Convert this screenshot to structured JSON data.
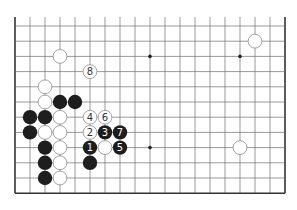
{
  "diagram": {
    "type": "go-board-fragment",
    "board_size": 19,
    "visible_rows": [
      7,
      18
    ],
    "visible_cols": [
      0,
      18
    ],
    "colors": {
      "background": "#ffffff",
      "grid_line": "#6e6e6e",
      "edge_line": "#333333",
      "black_stone": "#1e1e1e",
      "white_stone_fill": "#ffffff",
      "white_stone_stroke": "#8a8a8a",
      "star_point": "#222222"
    },
    "star_points": [
      {
        "col": 9,
        "row": 9
      },
      {
        "col": 15,
        "row": 9
      },
      {
        "col": 9,
        "row": 15
      }
    ],
    "stones": [
      {
        "color": "white",
        "col": 3,
        "row": 9,
        "label": ""
      },
      {
        "color": "white",
        "col": 16,
        "row": 8,
        "label": ""
      },
      {
        "color": "white",
        "col": 5,
        "row": 10,
        "label": "8"
      },
      {
        "color": "white",
        "col": 2,
        "row": 11,
        "label": ""
      },
      {
        "color": "white",
        "col": 2,
        "row": 12,
        "label": ""
      },
      {
        "color": "black",
        "col": 3,
        "row": 12,
        "label": ""
      },
      {
        "color": "black",
        "col": 4,
        "row": 12,
        "label": ""
      },
      {
        "color": "black",
        "col": 1,
        "row": 13,
        "label": ""
      },
      {
        "color": "black",
        "col": 2,
        "row": 13,
        "label": ""
      },
      {
        "color": "white",
        "col": 3,
        "row": 13,
        "label": ""
      },
      {
        "color": "white",
        "col": 5,
        "row": 13,
        "label": "4"
      },
      {
        "color": "white",
        "col": 6,
        "row": 13,
        "label": "6"
      },
      {
        "color": "black",
        "col": 1,
        "row": 14,
        "label": ""
      },
      {
        "color": "white",
        "col": 2,
        "row": 14,
        "label": ""
      },
      {
        "color": "white",
        "col": 3,
        "row": 14,
        "label": ""
      },
      {
        "color": "white",
        "col": 5,
        "row": 14,
        "label": "2"
      },
      {
        "color": "black",
        "col": 6,
        "row": 14,
        "label": "3"
      },
      {
        "color": "black",
        "col": 7,
        "row": 14,
        "label": "7"
      },
      {
        "color": "black",
        "col": 2,
        "row": 15,
        "label": ""
      },
      {
        "color": "white",
        "col": 3,
        "row": 15,
        "label": ""
      },
      {
        "color": "black",
        "col": 5,
        "row": 15,
        "label": "1"
      },
      {
        "color": "white",
        "col": 6,
        "row": 15,
        "label": ""
      },
      {
        "color": "black",
        "col": 7,
        "row": 15,
        "label": "5"
      },
      {
        "color": "white",
        "col": 15,
        "row": 15,
        "label": ""
      },
      {
        "color": "black",
        "col": 2,
        "row": 16,
        "label": ""
      },
      {
        "color": "white",
        "col": 3,
        "row": 16,
        "label": ""
      },
      {
        "color": "black",
        "col": 5,
        "row": 16,
        "label": ""
      },
      {
        "color": "black",
        "col": 2,
        "row": 17,
        "label": ""
      },
      {
        "color": "white",
        "col": 3,
        "row": 17,
        "label": ""
      }
    ]
  }
}
